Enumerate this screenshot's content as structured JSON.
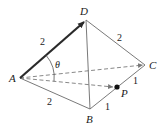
{
  "diagram": {
    "type": "tetrahedron",
    "colors": {
      "stroke": "#5a5a5a",
      "thick_stroke": "#2a2a2a",
      "text": "#1a1a1a",
      "point": "#111111"
    },
    "vertices": {
      "A": {
        "label": "A",
        "x": 20,
        "y": 78
      },
      "B": {
        "label": "B",
        "x": 90,
        "y": 109
      },
      "C": {
        "label": "C",
        "x": 145,
        "y": 65
      },
      "D": {
        "label": "D",
        "x": 86,
        "y": 20
      },
      "P": {
        "label": "P",
        "x": 117,
        "y": 87
      }
    },
    "edges": [
      {
        "from": "A",
        "to": "D",
        "style": "thick-arrow",
        "label": "2"
      },
      {
        "from": "D",
        "to": "C",
        "style": "solid",
        "label": "2"
      },
      {
        "from": "A",
        "to": "B",
        "style": "solid",
        "label": "2"
      },
      {
        "from": "D",
        "to": "B",
        "style": "solid",
        "label": ""
      },
      {
        "from": "B",
        "to": "P",
        "style": "solid",
        "label": "1"
      },
      {
        "from": "P",
        "to": "C",
        "style": "solid",
        "label": "1"
      },
      {
        "from": "A",
        "to": "C",
        "style": "dashed",
        "label": ""
      },
      {
        "from": "A",
        "to": "P",
        "style": "dashed-arrow",
        "label": ""
      }
    ],
    "angle": {
      "label": "θ",
      "vertex": "A",
      "between": [
        "D",
        "P"
      ]
    },
    "edge_labels": {
      "AD": "2",
      "DC": "2",
      "AB": "2",
      "BP": "1",
      "PC": "1"
    }
  }
}
